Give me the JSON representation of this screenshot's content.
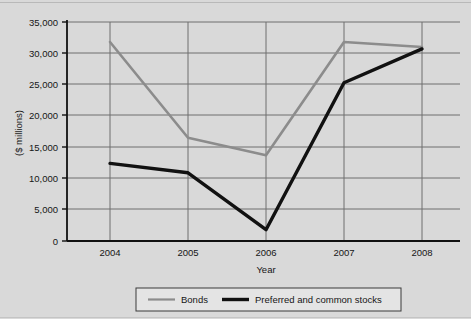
{
  "chart_data": {
    "type": "line",
    "title": "",
    "xlabel": "Year",
    "ylabel": "($ millions)",
    "categories": [
      "2004",
      "2005",
      "2006",
      "2007",
      "2008"
    ],
    "x": [
      2004,
      2005,
      2006,
      2007,
      2008
    ],
    "ylim": [
      0,
      35000
    ],
    "yticks": [
      0,
      5000,
      10000,
      15000,
      20000,
      25000,
      30000,
      35000
    ],
    "ytick_labels": [
      "0",
      "5,000",
      "10,000",
      "15,000",
      "20,000",
      "25,000",
      "30,000",
      "35,000"
    ],
    "grid": true,
    "grid_axis": "both",
    "legend_position": "bottom",
    "series": [
      {
        "name": "Bonds",
        "color": "#8c8c8c",
        "line_width": 2.6,
        "values": [
          31800,
          16500,
          13700,
          31800,
          31000
        ]
      },
      {
        "name": "Preferred and common stocks",
        "color": "#111111",
        "line_width": 3.4,
        "values": [
          12400,
          10900,
          1800,
          25300,
          30700
        ]
      }
    ]
  },
  "legend": {
    "items": [
      {
        "label": "Bonds",
        "color": "#8c8c8c",
        "thickness": 2.6
      },
      {
        "label": "Preferred and common stocks",
        "color": "#111111",
        "thickness": 3.4
      }
    ]
  },
  "axes": {
    "y_title": "($ millions)",
    "x_title": "Year",
    "y_labels": [
      "35,000",
      "30,000",
      "25,000",
      "20,000",
      "15,000",
      "10,000",
      "5,000",
      "0"
    ],
    "x_labels": [
      "2004",
      "2005",
      "2006",
      "2007",
      "2008"
    ]
  },
  "style": {
    "background": "#d9d9d9",
    "grid_color": "#6f6f6f",
    "axis_color": "#111111",
    "legend_background": "#e4e4e4",
    "legend_border": "#3b3b3b"
  }
}
